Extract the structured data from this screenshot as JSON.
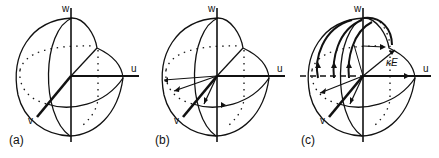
{
  "figure": {
    "panels": [
      {
        "id": "a",
        "label": "(a)",
        "axes": {
          "u": "u",
          "v": "v",
          "w": "w"
        }
      },
      {
        "id": "b",
        "label": "(b)",
        "axes": {
          "u": "u",
          "v": "v",
          "w": "w"
        }
      },
      {
        "id": "c",
        "label": "(c)",
        "axes": {
          "u": "u",
          "v": "v",
          "w": "w"
        },
        "annotation": "κE"
      }
    ],
    "colors": {
      "stroke": "#111111",
      "background": "#ffffff"
    }
  }
}
